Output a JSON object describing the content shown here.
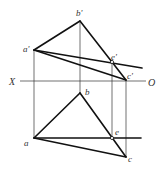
{
  "diagram": {
    "type": "orthographic-projection",
    "axis": {
      "left_label": "X",
      "right_label": "O"
    },
    "front_view": {
      "points": {
        "a_prime": {
          "label": "a'",
          "x": 34,
          "y": 50
        },
        "b_prime": {
          "label": "b'",
          "x": 80,
          "y": 21
        },
        "c_prime": {
          "label": "c'",
          "x": 126,
          "y": 80
        },
        "e_prime": {
          "label": "e'",
          "x": 112,
          "y": 62
        }
      }
    },
    "top_view": {
      "points": {
        "a": {
          "label": "a",
          "x": 34,
          "y": 138
        },
        "b": {
          "label": "b",
          "x": 80,
          "y": 93
        },
        "c": {
          "label": "c",
          "x": 126,
          "y": 157
        },
        "e": {
          "label": "e",
          "x": 112,
          "y": 138
        }
      }
    }
  }
}
